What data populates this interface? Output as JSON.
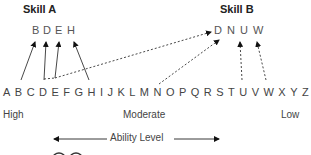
{
  "skill_a": {
    "title": "Skill A",
    "letters": [
      "B",
      "D",
      "E",
      "H"
    ]
  },
  "skill_b": {
    "title": "Skill B",
    "letters": [
      "D",
      "N",
      "U",
      "W"
    ]
  },
  "alphabet": [
    "A",
    "B",
    "C",
    "D",
    "E",
    "F",
    "G",
    "H",
    "I",
    "J",
    "K",
    "L",
    "M",
    "N",
    "O",
    "P",
    "Q",
    "R",
    "S",
    "T",
    "U",
    "V",
    "W",
    "X",
    "Y",
    "Z"
  ],
  "levels": {
    "high": "High",
    "moderate": "Moderate",
    "low": "Low"
  },
  "axis": {
    "label": "Ability Level"
  },
  "connections": [
    {
      "from": "B",
      "to": "Skill A: B",
      "style": "solid"
    },
    {
      "from": "D",
      "to": "Skill A: D",
      "style": "solid"
    },
    {
      "from": "E",
      "to": "Skill A: E",
      "style": "solid"
    },
    {
      "from": "H",
      "to": "Skill A: H",
      "style": "solid"
    },
    {
      "from": "D",
      "to": "Skill B: D",
      "style": "dashed"
    },
    {
      "from": "N",
      "to": "Skill B: N",
      "style": "dashed"
    },
    {
      "from": "U",
      "to": "Skill B: U",
      "style": "dashed"
    },
    {
      "from": "W",
      "to": "Skill B: W",
      "style": "dashed"
    }
  ]
}
